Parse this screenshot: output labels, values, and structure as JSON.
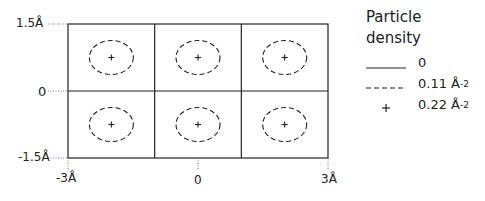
{
  "diagram": {
    "type": "density-map",
    "grid": {
      "rows": 2,
      "cols": 3
    },
    "x_axis": {
      "ticks": [
        {
          "value": -3,
          "label": "-3Å"
        },
        {
          "value": 0,
          "label": "0"
        },
        {
          "value": 3,
          "label": "3Å"
        }
      ],
      "range": [
        -3,
        3
      ]
    },
    "y_axis": {
      "ticks": [
        {
          "value": 1.5,
          "label": "1.5Å"
        },
        {
          "value": 0,
          "label": "0"
        },
        {
          "value": -1.5,
          "label": "-1.5Å"
        }
      ],
      "range": [
        -1.5,
        1.5
      ]
    },
    "cells": [
      {
        "row": 0,
        "col": 0
      },
      {
        "row": 0,
        "col": 1
      },
      {
        "row": 0,
        "col": 2
      },
      {
        "row": 1,
        "col": 0
      },
      {
        "row": 1,
        "col": 1
      },
      {
        "row": 1,
        "col": 2
      }
    ]
  },
  "legend": {
    "title_line1": "Particle",
    "title_line2": "density",
    "items": [
      {
        "style": "solid",
        "label": "0",
        "unit_sup": ""
      },
      {
        "style": "dashed",
        "label": "0.11 Å",
        "unit_sup": "-2"
      },
      {
        "style": "plus",
        "label": "0.22 Å",
        "unit_sup": "-2"
      }
    ]
  }
}
